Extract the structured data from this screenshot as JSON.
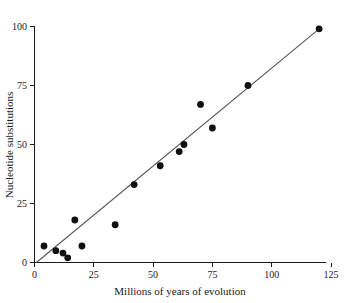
{
  "chart_data": {
    "type": "scatter",
    "title": "",
    "xlabel": "Millions of years of evolution",
    "ylabel": "Nucleotide substitutions",
    "xlim": [
      0,
      125
    ],
    "ylim": [
      0,
      100
    ],
    "xticks": [
      0,
      25,
      50,
      75,
      100,
      125
    ],
    "yticks": [
      0,
      25,
      50,
      75,
      100
    ],
    "xtick_labels": [
      "0",
      "25",
      "50",
      "75",
      "100",
      "125"
    ],
    "ytick_labels": [
      "0",
      "25",
      "50",
      "75",
      "100"
    ],
    "grid": false,
    "legend": null,
    "marker_color": "#101010",
    "line_color": "#55555a",
    "axis_color": "#1a1a1a",
    "points": [
      {
        "x": 4,
        "y": 7
      },
      {
        "x": 9,
        "y": 5
      },
      {
        "x": 12,
        "y": 4
      },
      {
        "x": 14,
        "y": 2
      },
      {
        "x": 17,
        "y": 18
      },
      {
        "x": 20,
        "y": 7
      },
      {
        "x": 34,
        "y": 16
      },
      {
        "x": 42,
        "y": 33
      },
      {
        "x": 53,
        "y": 41
      },
      {
        "x": 61,
        "y": 47
      },
      {
        "x": 63,
        "y": 50
      },
      {
        "x": 70,
        "y": 67
      },
      {
        "x": 75,
        "y": 57
      },
      {
        "x": 90,
        "y": 75
      },
      {
        "x": 120,
        "y": 99
      }
    ],
    "trendline": {
      "x_start": 0.8,
      "y_start": 0,
      "x_end": 120,
      "y_end": 99,
      "description": "fitted regression line through origin"
    }
  }
}
